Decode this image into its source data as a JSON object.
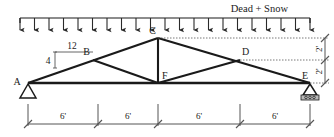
{
  "diagram": {
    "type": "truss-free-body-diagram",
    "load_label": "Dead + Snow",
    "nodes": [
      {
        "id": "A",
        "label": "A",
        "x": 28,
        "y": 83,
        "support": "pin"
      },
      {
        "id": "B",
        "label": "B",
        "x": 93,
        "y": 60,
        "support": "none"
      },
      {
        "id": "C",
        "label": "C",
        "x": 158,
        "y": 38,
        "support": "none"
      },
      {
        "id": "D",
        "label": "D",
        "x": 240,
        "y": 60,
        "support": "none"
      },
      {
        "id": "E",
        "label": "E",
        "x": 310,
        "y": 83,
        "support": "roller"
      },
      {
        "id": "F",
        "label": "F",
        "x": 158,
        "y": 83,
        "support": "none"
      }
    ],
    "slope_triangle": {
      "run_label": "12",
      "rise_label": "4"
    },
    "span_dimensions": {
      "labels": [
        "6'",
        "6'",
        "6'",
        "6'"
      ],
      "tick_x": [
        28,
        98,
        158,
        240,
        310
      ],
      "line_y": 124
    },
    "height_dimensions": {
      "labels": [
        "2'",
        "2'"
      ],
      "tick_y": [
        38,
        60,
        83
      ],
      "line_x": 325
    },
    "load": {
      "line_y": 18,
      "x_start": 20,
      "x_end": 310,
      "arrow_count": 21,
      "arrow_length": 12
    },
    "colors": {
      "ink": "#1a1a1a",
      "thin": "#555555",
      "paper": "#ffffff"
    }
  }
}
